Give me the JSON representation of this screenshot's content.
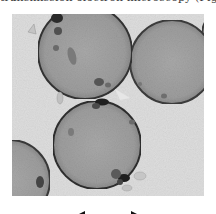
{
  "caption": {
    "text": "transmission electron microscopy (Fig. 2"
  },
  "figure": {
    "type": "TEM micrograph",
    "background_color": "#dcdcdc",
    "cells": [
      {
        "name": "cell-upper-left",
        "cx": 73,
        "cy": 38,
        "r": 47
      },
      {
        "name": "cell-upper-right",
        "cx": 160,
        "cy": 48,
        "r": 42
      },
      {
        "name": "cell-bottom-center",
        "cx": 85,
        "cy": 131,
        "r": 44
      },
      {
        "name": "cell-bottom-left",
        "cx": -2,
        "cy": 166,
        "r": 40
      },
      {
        "name": "cell-far-right",
        "cx": 214,
        "cy": 20,
        "r": 24
      }
    ]
  },
  "scalebar": {
    "type": "double-headed arrow",
    "label": ""
  }
}
